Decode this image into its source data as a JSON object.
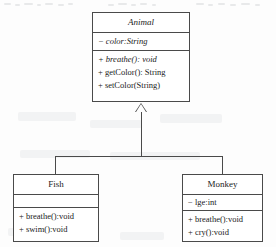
{
  "diagram": {
    "type": "uml-class-diagram",
    "relationship": "generalization",
    "relationship_label": "",
    "line_color": "#4a4a4a",
    "background_color": "#fdfdfd",
    "text_color": "#1b1b1b"
  },
  "classes": {
    "animal": {
      "name": "Animal",
      "abstract": true,
      "attributes": [
        {
          "text": "− color:String",
          "italic": true
        }
      ],
      "methods": [
        {
          "text": "+ breathe(): void",
          "italic": true
        },
        {
          "text": "+ getColor(): String",
          "italic": false
        },
        {
          "text": "+ setColor(String)",
          "italic": false
        }
      ]
    },
    "fish": {
      "name": "Fish",
      "abstract": false,
      "attributes": [],
      "methods": [
        {
          "text": "+ breathe():void",
          "italic": false
        },
        {
          "text": "+ swim():void",
          "italic": false
        }
      ]
    },
    "monkey": {
      "name": "Monkey",
      "abstract": false,
      "attributes": [
        {
          "text": "− lge:int",
          "italic": false
        }
      ],
      "methods": [
        {
          "text": "+ breathe():void",
          "italic": false
        },
        {
          "text": "+ cry():void",
          "italic": false
        }
      ]
    }
  }
}
